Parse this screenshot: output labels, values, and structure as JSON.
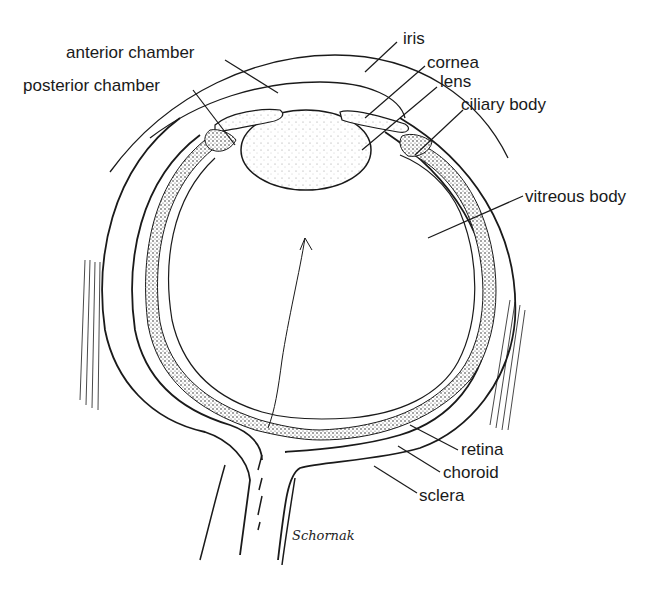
{
  "diagram": {
    "labels": [
      {
        "id": "anterior-chamber",
        "text": "anterior chamber",
        "x": 66,
        "y": 44
      },
      {
        "id": "posterior-chamber",
        "text": "posterior chamber",
        "x": 23,
        "y": 77
      },
      {
        "id": "iris",
        "text": "iris",
        "x": 403,
        "y": 30
      },
      {
        "id": "cornea",
        "text": "cornea",
        "x": 427,
        "y": 54
      },
      {
        "id": "lens",
        "text": "lens",
        "x": 440,
        "y": 73
      },
      {
        "id": "ciliary-body",
        "text": "ciliary body",
        "x": 461,
        "y": 96
      },
      {
        "id": "vitreous-body",
        "text": "vitreous body",
        "x": 525,
        "y": 188
      },
      {
        "id": "retina",
        "text": "retina",
        "x": 461,
        "y": 441
      },
      {
        "id": "choroid",
        "text": "choroid",
        "x": 443,
        "y": 464
      },
      {
        "id": "sclera",
        "text": "sclera",
        "x": 419,
        "y": 487
      }
    ],
    "signature": "Schornak",
    "colors": {
      "ink": "#1a1a1a",
      "background": "#ffffff",
      "stipple": "#555555"
    }
  }
}
